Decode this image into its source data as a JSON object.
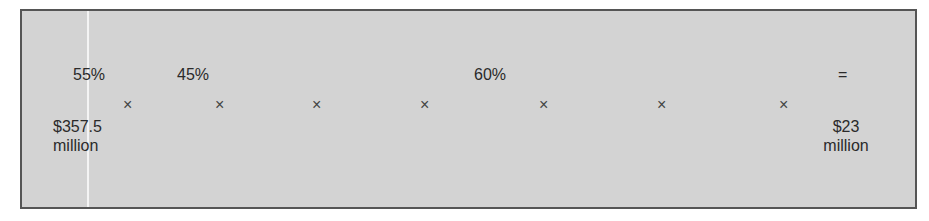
{
  "diagram": {
    "percents": [
      "55%",
      "45%",
      "60%"
    ],
    "equals": "=",
    "multiply": "×",
    "start_value": {
      "amount": "$357.5",
      "unit": "million"
    },
    "end_value": {
      "amount": "$23",
      "unit": "million"
    }
  }
}
